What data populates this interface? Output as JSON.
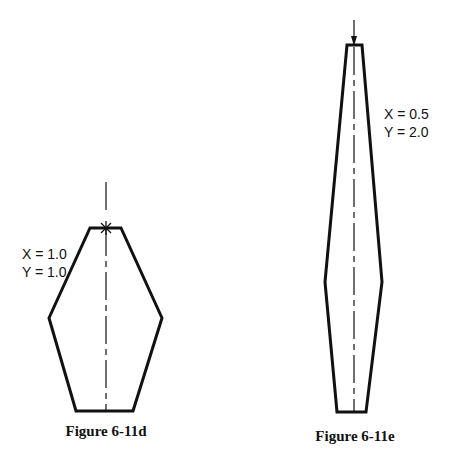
{
  "figures": [
    {
      "id": "d",
      "caption": "Figure 6-11d",
      "x_label": "X = 1.0",
      "y_label": "Y = 1.0"
    },
    {
      "id": "e",
      "caption": "Figure 6-11e",
      "x_label": "X = 0.5",
      "y_label": "Y = 2.0"
    }
  ],
  "colors": {
    "stroke": "#111111",
    "background": "#ffffff"
  }
}
